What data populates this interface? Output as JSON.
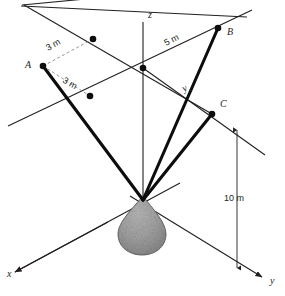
{
  "figure": {
    "kind": "3d-statics-diagram",
    "background_color": "#ffffff",
    "line_color": "#231f20",
    "cable_color": "#0d0d0d",
    "dashed_color": "#8b8b8b",
    "cone_color": "#9d9d9d"
  },
  "axes": [
    {
      "name": "x-axis",
      "label": "x",
      "label_x": 8,
      "label_y": 276
    },
    {
      "name": "y-axis",
      "label": "y",
      "label_x": 270,
      "label_y": 283
    },
    {
      "name": "z-axis",
      "label": "z",
      "label_x": 148,
      "label_y": 17
    }
  ],
  "points": [
    {
      "name": "point-a",
      "label": "A",
      "label_x": 31,
      "label_y": 68,
      "cx": 43,
      "cy": 66
    },
    {
      "name": "point-b",
      "label": "B",
      "label_x": 227,
      "label_y": 35,
      "cx": 218,
      "cy": 28
    },
    {
      "name": "point-c",
      "label": "C",
      "label_x": 220,
      "label_y": 107,
      "cx": 212,
      "cy": 114
    },
    {
      "name": "origin-node",
      "label": "",
      "label_x": 0,
      "label_y": 0,
      "cx": 143,
      "cy": 68
    },
    {
      "name": "offset-node-upper",
      "label": "",
      "label_x": 0,
      "label_y": 0,
      "cx": 93,
      "cy": 39
    },
    {
      "name": "offset-node-lower",
      "label": "",
      "label_x": 0,
      "label_y": 0,
      "cx": 90,
      "cy": 96
    }
  ],
  "dimensions": [
    {
      "name": "dim-3m-upper",
      "label": "3 m",
      "x": 48,
      "y": 51,
      "rotation": -30
    },
    {
      "name": "dim-3m-lower",
      "label": "3 m",
      "x": 62,
      "y": 81,
      "rotation": 30
    },
    {
      "name": "dim-5m",
      "label": "5 m",
      "x": 168,
      "y": 44,
      "rotation": -27
    },
    {
      "name": "dim-10m",
      "label": "10 m",
      "x": 237,
      "y": 198,
      "rotation": 0
    },
    {
      "name": "dim-yc",
      "label": "y",
      "sub": "c",
      "x": 186,
      "y": 92,
      "rotation": -27
    }
  ],
  "apex": {
    "name": "suspension-apex",
    "cx": 143,
    "cy": 200
  }
}
